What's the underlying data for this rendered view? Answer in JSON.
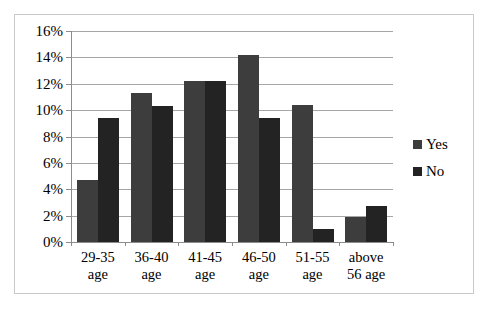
{
  "chart_data": {
    "type": "bar",
    "title": "",
    "subtitle": "",
    "xlabel": "",
    "ylabel": "",
    "categories": [
      {
        "line1": "29-35",
        "line2": "age"
      },
      {
        "line1": "36-40",
        "line2": "age"
      },
      {
        "line1": "41-45",
        "line2": "age"
      },
      {
        "line1": "46-50",
        "line2": "age"
      },
      {
        "line1": "51-55",
        "line2": "age"
      },
      {
        "line1": "above",
        "line2": "56 age"
      }
    ],
    "series": [
      {
        "name": "Yes",
        "color": "#3d3d3d",
        "values": [
          4.7,
          11.3,
          12.2,
          14.2,
          10.4,
          1.9
        ]
      },
      {
        "name": "No",
        "color": "#232323",
        "values": [
          9.4,
          10.3,
          12.2,
          9.4,
          1.0,
          2.7
        ]
      }
    ],
    "ylim": [
      0,
      16
    ],
    "ytick_step": 2,
    "ytick_labels": [
      "16%",
      "14%",
      "12%",
      "10%",
      "8%",
      "6%",
      "4%",
      "2%",
      "0%"
    ],
    "ytick_values": [
      16,
      14,
      12,
      10,
      8,
      6,
      4,
      2,
      0
    ],
    "grid": true,
    "grid_axis": "y",
    "legend_position": "right",
    "legend_entries": [
      "Yes",
      "No"
    ],
    "value_suffix": "%"
  }
}
